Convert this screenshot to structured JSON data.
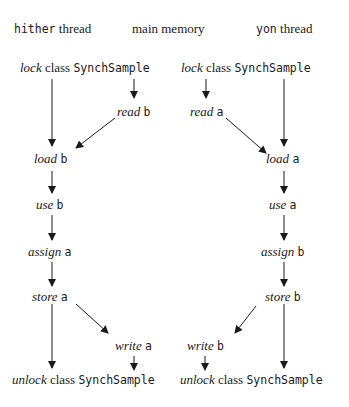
{
  "headers": {
    "hither": {
      "code": "hither",
      "text": " thread"
    },
    "memory": {
      "text": "main memory"
    },
    "yon": {
      "code": "yon",
      "text": " thread"
    }
  },
  "hither_column": [
    {
      "action": "lock",
      "rest": " class ",
      "code": "SynchSample"
    },
    {
      "action": "load",
      "code": "b"
    },
    {
      "action": "use",
      "code": "b"
    },
    {
      "action": "assign",
      "code": "a"
    },
    {
      "action": "store",
      "code": "a"
    },
    {
      "action": "unlock",
      "rest": " class ",
      "code": "SynchSample"
    }
  ],
  "hither_memory": [
    {
      "action": "read",
      "code": "b"
    },
    {
      "action": "write",
      "code": "a"
    }
  ],
  "yon_column": [
    {
      "action": "lock",
      "rest": " class ",
      "code": "SynchSample"
    },
    {
      "action": "load",
      "code": "a"
    },
    {
      "action": "use",
      "code": "a"
    },
    {
      "action": "assign",
      "code": "b"
    },
    {
      "action": "store",
      "code": "b"
    },
    {
      "action": "unlock",
      "rest": " class ",
      "code": "SynchSample"
    }
  ],
  "yon_memory": [
    {
      "action": "read",
      "code": "a"
    },
    {
      "action": "write",
      "code": "b"
    }
  ]
}
